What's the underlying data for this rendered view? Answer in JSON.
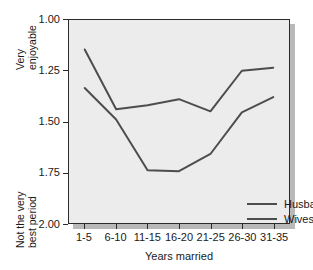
{
  "chart_data": {
    "type": "line",
    "title": "",
    "xlabel": "Years married",
    "ylabel": "",
    "categories": [
      "1-5",
      "6-10",
      "11-15",
      "16-20",
      "21-25",
      "26-30",
      "31-35"
    ],
    "yticks": [
      "1.00",
      "1.25",
      "1.50",
      "1.75",
      "2.00"
    ],
    "ytick_values": [
      1.0,
      1.25,
      1.5,
      1.75,
      2.0
    ],
    "ylim": [
      1.0,
      2.0
    ],
    "y_axis_inverted": true,
    "y_axis_top_annotation": [
      "Very",
      "enjoyable"
    ],
    "y_axis_bottom_annotation": [
      "Not the very",
      "best period"
    ],
    "grid": false,
    "legend_position": "inside-lower-right",
    "series": [
      {
        "name": "Husbands",
        "color": "#4d4d4d",
        "values": [
          1.145,
          1.44,
          1.42,
          1.39,
          1.45,
          1.25,
          1.235
        ]
      },
      {
        "name": "Wives",
        "color": "#4d4d4d",
        "values": [
          1.335,
          1.49,
          1.74,
          1.745,
          1.66,
          1.455,
          1.38
        ]
      }
    ]
  },
  "legend": {
    "items": [
      {
        "label": "Husbands"
      },
      {
        "label": "Wives"
      }
    ]
  },
  "axis": {
    "x_title": "Years married"
  }
}
